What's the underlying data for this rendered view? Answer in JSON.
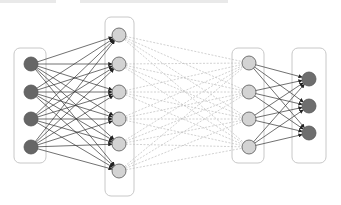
{
  "diagram": {
    "type": "feedforward-neural-network",
    "caption_visible": false,
    "colors": {
      "input_node": "#666666",
      "hidden_node": "#d3d3d3",
      "output_node": "#6e6e6e",
      "node_stroke": "#555555",
      "solid_edge": "#333333",
      "dashed_edge": "#bdbdbd",
      "layer_box": "#c8c8c8"
    },
    "layers": [
      {
        "name": "input",
        "box": [
          14,
          48,
          32,
          115
        ],
        "x": 31,
        "ys": [
          64,
          92,
          119,
          147
        ],
        "fill": "input_node"
      },
      {
        "name": "hidden-1",
        "box": [
          105,
          17,
          29,
          179
        ],
        "x": 119,
        "ys": [
          35,
          64,
          92,
          119,
          144,
          171
        ],
        "fill": "hidden_node"
      },
      {
        "name": "hidden-2",
        "box": [
          232,
          48,
          32,
          115
        ],
        "x": 249,
        "ys": [
          63,
          92,
          119,
          147
        ],
        "fill": "hidden_node"
      },
      {
        "name": "output",
        "box": [
          292,
          48,
          34,
          115
        ],
        "x": 309,
        "ys": [
          79,
          106,
          133
        ],
        "fill": "output_node"
      }
    ],
    "connections": [
      {
        "from": 0,
        "to": 1,
        "style": "solid-arrow"
      },
      {
        "from": 1,
        "to": 2,
        "style": "dashed"
      },
      {
        "from": 2,
        "to": 3,
        "style": "solid-arrow"
      }
    ],
    "node_radius": 7
  }
}
